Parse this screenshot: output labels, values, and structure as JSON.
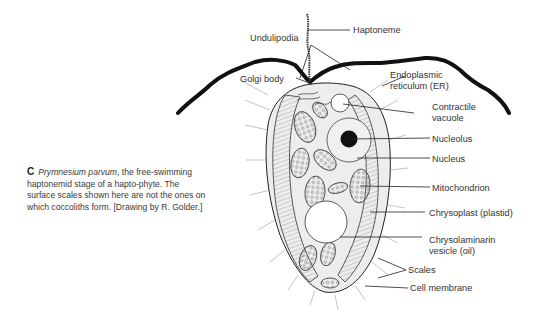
{
  "caption": {
    "letter": "C",
    "species": "Prymnesium parvum",
    "text": ", the free-swimming haptonemid stage of a hapto-phyte. The surface scales shown here are not the ones on which coccoliths form. [Drawing by R. Golder.]"
  },
  "labels": {
    "haptoneme": "Haptoneme",
    "undulipodia": "Undulipodia",
    "golgi_body": "Golgi body",
    "er_line1": "Endoplasmic",
    "er_line2": "reticulum (ER)",
    "contractile_line1": "Contractile",
    "contractile_line2": "vacuole",
    "nucleolus": "Nucleolus",
    "nucleus": "Nucleus",
    "mitochondrion": "Mitochondrion",
    "chrysoplast": "Chrysoplast (plastid)",
    "chrysolaminarin_line1": "Chrysolaminarin",
    "chrysolaminarin_line2": "vesicle (oil)",
    "scales": "Scales",
    "cell_membrane": "Cell membrane"
  },
  "colors": {
    "ink": "#1a1a1a",
    "label": "#333333",
    "shade": "#d8d8d8",
    "nucleolus": "#111111"
  }
}
